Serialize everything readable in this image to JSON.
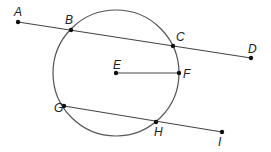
{
  "diagram": {
    "type": "geometry-circle",
    "circle": {
      "center": "E",
      "cx": 116,
      "cy": 73,
      "r": 63,
      "stroke": "#555555"
    },
    "points": [
      {
        "name": "A",
        "x": 18,
        "y": 22,
        "lx": 14,
        "ly": 16
      },
      {
        "name": "B",
        "x": 71,
        "y": 30,
        "lx": 65,
        "ly": 24
      },
      {
        "name": "C",
        "x": 173,
        "y": 46,
        "lx": 176,
        "ly": 41
      },
      {
        "name": "D",
        "x": 251,
        "y": 58,
        "lx": 248,
        "ly": 53
      },
      {
        "name": "E",
        "x": 116,
        "y": 73,
        "lx": 113,
        "ly": 69
      },
      {
        "name": "F",
        "x": 179,
        "y": 73,
        "lx": 183,
        "ly": 78
      },
      {
        "name": "G",
        "x": 64,
        "y": 106,
        "lx": 54,
        "ly": 112
      },
      {
        "name": "H",
        "x": 156,
        "y": 122,
        "lx": 154,
        "ly": 136
      },
      {
        "name": "I",
        "x": 222,
        "y": 132,
        "lx": 218,
        "ly": 146
      }
    ],
    "segments": [
      {
        "name": "AD",
        "from": "A",
        "to": "D"
      },
      {
        "name": "EF",
        "from": "E",
        "to": "F"
      },
      {
        "name": "GI",
        "from": "G",
        "to": "I"
      }
    ],
    "labels": {
      "A": "A",
      "B": "B",
      "C": "C",
      "D": "D",
      "E": "E",
      "F": "F",
      "G": "G",
      "H": "H",
      "I": "I"
    }
  }
}
